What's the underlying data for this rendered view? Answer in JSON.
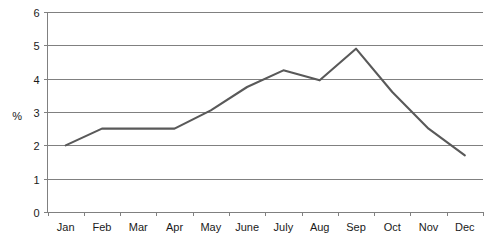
{
  "chart_data": {
    "type": "line",
    "title": "",
    "subtitle": "",
    "xlabel": "",
    "ylabel": "%",
    "categories": [
      "Jan",
      "Feb",
      "Mar",
      "Apr",
      "May",
      "June",
      "July",
      "Aug",
      "Sep",
      "Oct",
      "Nov",
      "Dec"
    ],
    "values": [
      2.0,
      2.5,
      2.5,
      2.5,
      3.05,
      3.75,
      4.25,
      3.95,
      4.9,
      3.6,
      2.5,
      1.7
    ],
    "series": [
      {
        "name": "",
        "values": [
          2.0,
          2.5,
          2.5,
          2.5,
          3.05,
          3.75,
          4.25,
          3.95,
          4.9,
          3.6,
          2.5,
          1.7
        ]
      }
    ],
    "ylim": [
      0,
      6
    ],
    "y_ticks": [
      0,
      1,
      2,
      3,
      4,
      5,
      6
    ],
    "y_tick_labels": [
      "0",
      "1",
      "2",
      "3",
      "4",
      "5",
      "6"
    ],
    "grid": true,
    "grid_axis": "y",
    "legend": false,
    "legend_position": "none",
    "markers": false,
    "line_color": "#595959",
    "grid_color": "#808080",
    "axis_color": "#808080",
    "background_color": "#ffffff",
    "annotations": []
  },
  "axes": {
    "y_axis_title": "%",
    "y_tick_labels": [
      "6",
      "5",
      "4",
      "3",
      "2",
      "1",
      "0"
    ],
    "x_tick_labels": [
      "Jan",
      "Feb",
      "Mar",
      "Apr",
      "May",
      "June",
      "July",
      "Aug",
      "Sep",
      "Oct",
      "Nov",
      "Dec"
    ]
  }
}
